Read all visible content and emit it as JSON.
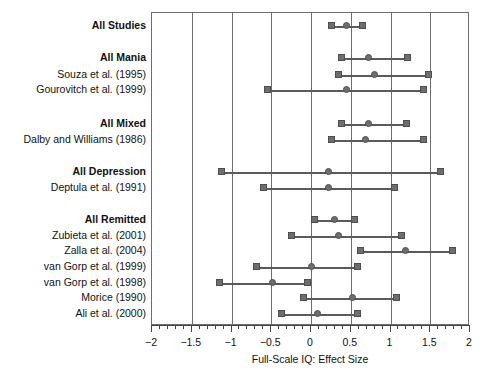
{
  "chart_data": {
    "type": "forest",
    "title": "",
    "xlabel": "Full-Scale IQ: Effect Size",
    "ylabel": "",
    "xlim": [
      -2,
      2
    ],
    "xticks": [
      -2,
      -1.5,
      -1,
      -0.5,
      0,
      0.5,
      1,
      1.5,
      2
    ],
    "xtick_labels": [
      "−2",
      "−1.5",
      "−1",
      "−0.5",
      "0",
      "0.5",
      "1",
      "1.5",
      "2"
    ],
    "minor_tick_step": 0.1,
    "grid": "vertical-at-major-ticks",
    "legend": "none",
    "marker_center": "circle",
    "marker_bounds": "square",
    "rows": [
      {
        "label": "All Studies",
        "group": true,
        "estimate": 0.45,
        "ci_low": 0.26,
        "ci_high": 0.65
      },
      {
        "label": "All Mania",
        "group": true,
        "estimate": 0.72,
        "ci_low": 0.38,
        "ci_high": 1.21
      },
      {
        "label": "Souza et al. (1995)",
        "group": false,
        "estimate": 0.8,
        "ci_low": 0.34,
        "ci_high": 1.48
      },
      {
        "label": "Gourovitch et al. (1999)",
        "group": false,
        "estimate": 0.45,
        "ci_low": -0.55,
        "ci_high": 1.41
      },
      {
        "label": "All Mixed",
        "group": true,
        "estimate": 0.72,
        "ci_low": 0.38,
        "ci_high": 1.2
      },
      {
        "label": "Dalby and Williams (1986)",
        "group": false,
        "estimate": 0.68,
        "ci_low": 0.26,
        "ci_high": 1.42
      },
      {
        "label": "All Depression",
        "group": true,
        "estimate": 0.22,
        "ci_low": -1.13,
        "ci_high": 1.63
      },
      {
        "label": "Deptula et al. (1991)",
        "group": false,
        "estimate": 0.22,
        "ci_low": -0.6,
        "ci_high": 1.05
      },
      {
        "label": "All Remitted",
        "group": true,
        "estimate": 0.3,
        "ci_low": 0.05,
        "ci_high": 0.55
      },
      {
        "label": "Zubieta et al. (2001)",
        "group": false,
        "estimate": 0.35,
        "ci_low": -0.25,
        "ci_high": 1.14
      },
      {
        "label": "Zalla et al. (2004)",
        "group": false,
        "estimate": 1.19,
        "ci_low": 0.62,
        "ci_high": 1.78
      },
      {
        "label": "van Gorp et al. (1999)",
        "group": false,
        "estimate": 0.0,
        "ci_low": -0.68,
        "ci_high": 0.58
      },
      {
        "label": "van Gorp et al. (1998)",
        "group": false,
        "estimate": -0.48,
        "ci_low": -1.15,
        "ci_high": -0.05
      },
      {
        "label": "Morice (1990)",
        "group": false,
        "estimate": 0.52,
        "ci_low": -0.1,
        "ci_high": 1.08
      },
      {
        "label": "Ali et al. (2000)",
        "group": false,
        "estimate": 0.08,
        "ci_low": -0.37,
        "ci_high": 0.58
      }
    ]
  },
  "colors": {
    "frame": "#6d6d6d",
    "gridline": "#6d6d6d",
    "marker_fill": "#6e6e6e",
    "marker_stroke": "#4e4e4e",
    "line": "#5a5a5a",
    "text": "#111111",
    "background": "#ffffff"
  }
}
